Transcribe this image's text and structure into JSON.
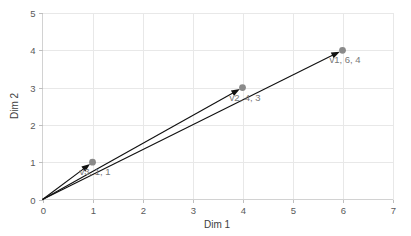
{
  "chart_data": {
    "type": "scatter",
    "title": "",
    "subtitle": "",
    "xlabel": "Dim 1",
    "ylabel": "Dim 2",
    "xlim": [
      0,
      7
    ],
    "ylim": [
      0,
      5
    ],
    "xticks": [
      "0",
      "1",
      "2",
      "3",
      "4",
      "5",
      "6",
      "7"
    ],
    "yticks": [
      "0",
      "1",
      "2",
      "3",
      "4",
      "5"
    ],
    "grid": true,
    "legend": "none",
    "style": "vectors-from-origin",
    "colors": {
      "vector": "#111111",
      "marker": "#8a8a8a",
      "grid": "#e8e8e8",
      "axis": "#d2d2d2",
      "label_text": "#787878",
      "tick_text": "#595959",
      "background": "#ffffff"
    },
    "points": [
      {
        "name": "v1",
        "x": 6,
        "y": 4,
        "label": "v1, 6, 4",
        "origin": [
          0,
          0
        ]
      },
      {
        "name": "v2",
        "x": 4,
        "y": 3,
        "label": "v2, 4, 3",
        "origin": [
          0,
          0
        ]
      },
      {
        "name": "v3",
        "x": 1,
        "y": 1,
        "label": "v3, 1, 1",
        "origin": [
          0,
          0
        ]
      }
    ],
    "annotations": [
      "v1, 6, 4",
      "v2, 4, 3",
      "v3, 1, 1"
    ]
  }
}
